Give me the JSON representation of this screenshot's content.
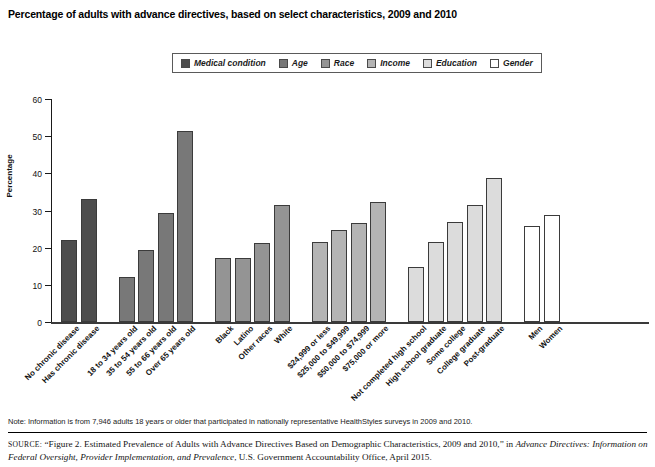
{
  "figure": {
    "title": "Percentage of adults with advance directives, based on select characteristics, 2009 and 2010",
    "note": "Note: Information is from 7,946 adults 18 years or older that participated in nationally representative HealthStyles surveys in 2009 and 2010.",
    "source_prefix": "SOURCE:",
    "source_quote": "“Figure 2. Estimated Prevalence of Adults with Advance Directives Based on Demographic Characteristics, 2009 and 2010,” in ",
    "source_italic_1": "Advance Directives: Information on Federal Oversight, Provider Implementation, and Prevalence",
    "source_tail": ", U.S. Government Accountability Office, April 2015."
  },
  "legend": {
    "items": [
      {
        "label": "Medical condition",
        "color": "#4d4d4d"
      },
      {
        "label": "Age",
        "color": "#787878"
      },
      {
        "label": "Race",
        "color": "#949494"
      },
      {
        "label": "Income",
        "color": "#b4b4b4"
      },
      {
        "label": "Education",
        "color": "#dcdcdc"
      },
      {
        "label": "Gender",
        "color": "#ffffff"
      }
    ]
  },
  "chart_data": {
    "type": "bar",
    "title": "Percentage of adults with advance directives, based on select characteristics, 2009 and 2010",
    "xlabel": "",
    "ylabel": "Percentage",
    "ylim": [
      0,
      60
    ],
    "yticks": [
      0,
      10,
      20,
      30,
      40,
      50,
      60
    ],
    "grid": false,
    "legend_position": "top-center",
    "groups": [
      {
        "name": "Medical condition",
        "color": "#4d4d4d",
        "categories": [
          "No chronic disease",
          "Has chronic disease"
        ],
        "values": [
          22.1,
          33.1
        ]
      },
      {
        "name": "Age",
        "color": "#787878",
        "categories": [
          "18 to 34 years old",
          "35 to 54 years old",
          "55 to 66 years old",
          "Over 65 years old"
        ],
        "values": [
          12.2,
          19.3,
          29.2,
          51.5
        ]
      },
      {
        "name": "Race",
        "color": "#949494",
        "categories": [
          "Black",
          "Latino",
          "Other races",
          "White"
        ],
        "values": [
          17.2,
          17.2,
          21.3,
          31.4
        ]
      },
      {
        "name": "Income",
        "color": "#b4b4b4",
        "categories": [
          "$24,999 or less",
          "$25,000 to $49,999",
          "$50,000 to $74,999",
          "$75,000 or more"
        ],
        "values": [
          21.5,
          24.7,
          26.6,
          32.4
        ]
      },
      {
        "name": "Education",
        "color": "#dcdcdc",
        "categories": [
          "Not completed high school",
          "High school graduate",
          "Some college",
          "College graduate",
          "Post-graduate"
        ],
        "values": [
          14.7,
          21.6,
          26.8,
          31.6,
          38.7
        ]
      },
      {
        "name": "Gender",
        "color": "#ffffff",
        "categories": [
          "Men",
          "Women"
        ],
        "values": [
          25.9,
          28.8
        ]
      }
    ]
  }
}
